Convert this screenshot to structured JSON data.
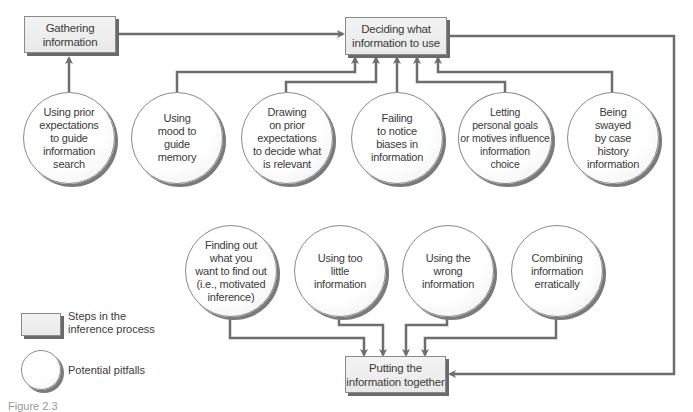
{
  "diagram": {
    "steps": {
      "gathering": "Gathering\ninformation",
      "deciding": "Deciding what\ninformation to use",
      "putting": "Putting the\ninformation together"
    },
    "pitfalls_top": [
      "Using prior\nexpectations\nto guide\ninformation\nsearch",
      "Using\nmood to\nguide\nmemory",
      "Drawing\non prior\nexpectations\nto decide what\nis relevant",
      "Failing\nto notice\nbiases in\ninformation",
      "Letting\npersonal goals\nor motives influence\ninformation\nchoice",
      "Being\nswayed\nby case\nhistory\ninformation"
    ],
    "pitfalls_bottom": [
      "Finding out\nwhat you\nwant to find out\n(i.e., motivated\ninference)",
      "Using too\nlittle\ninformation",
      "Using the\nwrong\ninformation",
      "Combining\ninformation\nerratically"
    ],
    "legend": {
      "step_label": "Steps in the\ninference process",
      "pitfall_label": "Potential pitfalls"
    },
    "caption": "Figure 2.3"
  },
  "colors": {
    "line": "#6e6e6e",
    "box_fill": "#eeeeee",
    "shadow": "#6a6a6a"
  }
}
